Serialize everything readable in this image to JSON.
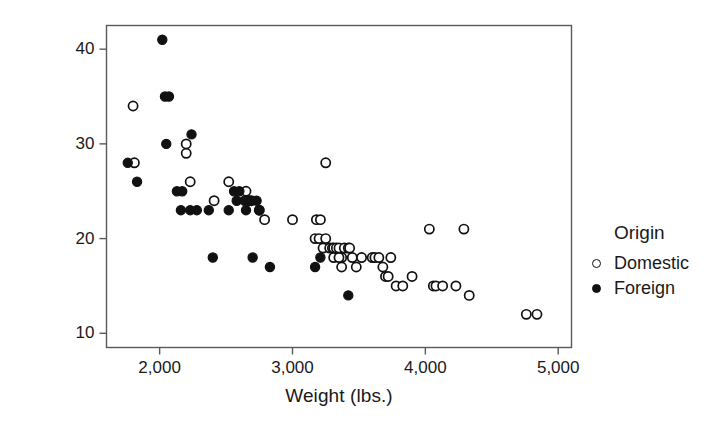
{
  "chart_data": {
    "type": "scatter",
    "title": "",
    "xlabel": "Weight (lbs.)",
    "ylabel": "Mileage (mpg)",
    "xlim": [
      1600,
      5100
    ],
    "ylim": [
      8.5,
      42.5
    ],
    "xticks": [
      2000,
      3000,
      4000,
      5000
    ],
    "xticklabels": [
      "2,000",
      "3,000",
      "4,000",
      "5,000"
    ],
    "yticks": [
      10,
      20,
      30,
      40
    ],
    "yticklabels": [
      "10",
      "20",
      "30",
      "40"
    ],
    "grid": false,
    "legend": {
      "title": "Origin",
      "position": "right",
      "entries": [
        {
          "name": "Domestic",
          "marker": "open-circle"
        },
        {
          "name": "Foreign",
          "marker": "filled-circle"
        }
      ]
    },
    "series": [
      {
        "name": "Domestic",
        "marker": "open-circle",
        "points": [
          [
            1800,
            34
          ],
          [
            1810,
            28
          ],
          [
            2230,
            26
          ],
          [
            2200,
            29
          ],
          [
            2200,
            30
          ],
          [
            2410,
            24
          ],
          [
            2520,
            26
          ],
          [
            2650,
            25
          ],
          [
            2690,
            24
          ],
          [
            2670,
            24
          ],
          [
            2750,
            23
          ],
          [
            2790,
            22
          ],
          [
            3000,
            22
          ],
          [
            3180,
            22
          ],
          [
            3210,
            22
          ],
          [
            3250,
            28
          ],
          [
            3170,
            20
          ],
          [
            3200,
            20
          ],
          [
            3230,
            19
          ],
          [
            3250,
            20
          ],
          [
            3280,
            19
          ],
          [
            3300,
            19
          ],
          [
            3310,
            19
          ],
          [
            3330,
            19
          ],
          [
            3350,
            19
          ],
          [
            3370,
            18
          ],
          [
            3390,
            19
          ],
          [
            3420,
            19
          ],
          [
            3430,
            19
          ],
          [
            3310,
            18
          ],
          [
            3350,
            18
          ],
          [
            3370,
            17
          ],
          [
            3450,
            18
          ],
          [
            3480,
            17
          ],
          [
            3520,
            18
          ],
          [
            3600,
            18
          ],
          [
            3620,
            18
          ],
          [
            3650,
            18
          ],
          [
            3680,
            17
          ],
          [
            3700,
            16
          ],
          [
            3720,
            16
          ],
          [
            3740,
            18
          ],
          [
            3780,
            15
          ],
          [
            3830,
            15
          ],
          [
            3900,
            16
          ],
          [
            4030,
            21
          ],
          [
            4060,
            15
          ],
          [
            4080,
            15
          ],
          [
            4130,
            15
          ],
          [
            4230,
            15
          ],
          [
            4290,
            21
          ],
          [
            4330,
            14
          ],
          [
            4760,
            12
          ],
          [
            4840,
            12
          ]
        ]
      },
      {
        "name": "Foreign",
        "marker": "filled-circle",
        "points": [
          [
            1760,
            28
          ],
          [
            1830,
            26
          ],
          [
            2020,
            41
          ],
          [
            2040,
            35
          ],
          [
            2070,
            35
          ],
          [
            2050,
            30
          ],
          [
            2130,
            25
          ],
          [
            2170,
            25
          ],
          [
            2240,
            31
          ],
          [
            2160,
            23
          ],
          [
            2230,
            23
          ],
          [
            2280,
            23
          ],
          [
            2370,
            23
          ],
          [
            2400,
            18
          ],
          [
            2520,
            23
          ],
          [
            2560,
            25
          ],
          [
            2580,
            24
          ],
          [
            2600,
            25
          ],
          [
            2640,
            24
          ],
          [
            2650,
            23
          ],
          [
            2700,
            18
          ],
          [
            2750,
            23
          ],
          [
            2830,
            17
          ],
          [
            3170,
            17
          ],
          [
            3210,
            18
          ],
          [
            3420,
            14
          ],
          [
            2680,
            24
          ],
          [
            2730,
            24
          ]
        ]
      }
    ]
  },
  "axes": {
    "x_title": "Weight (lbs.)",
    "y_title": "Mileage (mpg)"
  }
}
